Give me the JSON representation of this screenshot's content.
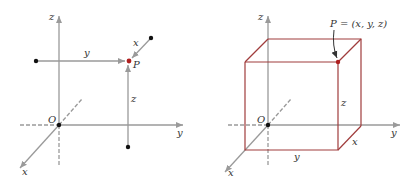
{
  "colors": {
    "axis": "#9a9a9a",
    "box": "#a03c3c",
    "point": "#b02020",
    "dot": "#111111",
    "text": "#333333"
  },
  "left_figure": {
    "axis_labels": {
      "z": "z",
      "y": "y",
      "x": "x"
    },
    "origin_label": "O",
    "point_label": "P",
    "projection_labels": {
      "y": "y",
      "x": "x",
      "z": "z"
    }
  },
  "right_figure": {
    "axis_labels": {
      "z": "z",
      "y": "y",
      "x": "x"
    },
    "origin_label": "O",
    "point_label": "P = (x, y, z)",
    "edge_labels": {
      "z": "z",
      "x": "x",
      "y": "y"
    }
  }
}
